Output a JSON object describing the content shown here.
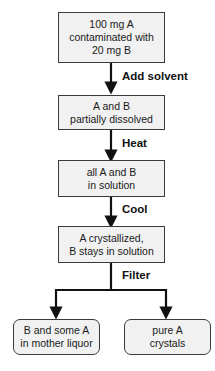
{
  "flowchart": {
    "steps": [
      {
        "lines": [
          "100 mg A",
          "contaminated with",
          "20 mg B"
        ]
      },
      {
        "lines": [
          "A and B",
          "partially dissolved"
        ]
      },
      {
        "lines": [
          "all A and B",
          "in solution"
        ]
      },
      {
        "lines": [
          "A crystallized,",
          "B stays in solution"
        ]
      }
    ],
    "actions": [
      "Add solvent",
      "Heat",
      "Cool",
      "Filter"
    ],
    "outcomes": [
      {
        "lines": [
          "B and some A",
          "in mother liquor"
        ]
      },
      {
        "lines": [
          "pure A",
          "crystals"
        ]
      }
    ]
  }
}
